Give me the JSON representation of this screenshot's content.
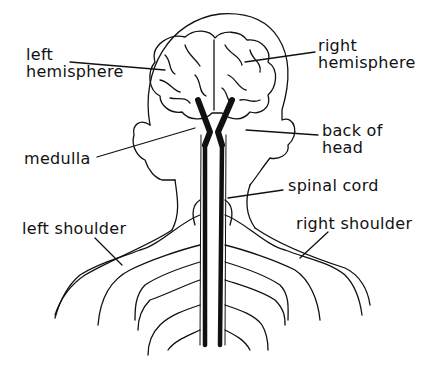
{
  "diagram": {
    "labels": {
      "left_hemisphere": [
        "left",
        "hemisphere"
      ],
      "right_hemisphere": [
        "right",
        "hemisphere"
      ],
      "back_of_head": [
        "back of",
        "head"
      ],
      "medulla": "medulla",
      "spinal_cord": "spinal cord",
      "left_shoulder": "left shoulder",
      "right_shoulder": "right shoulder"
    },
    "colors": {
      "ink": "#111111",
      "background": "#ffffff"
    }
  }
}
